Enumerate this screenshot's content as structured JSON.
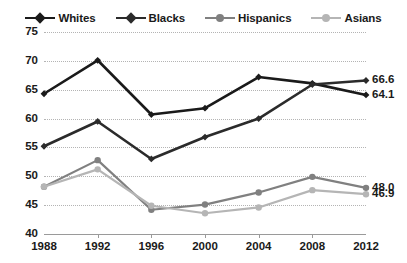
{
  "chart_data": {
    "type": "line",
    "title": "",
    "subtitle": "",
    "xlabel": "",
    "ylabel": "",
    "x": [
      1988,
      1992,
      1996,
      2000,
      2004,
      2008,
      2012
    ],
    "categories": [
      "1988",
      "1992",
      "1996",
      "2000",
      "2004",
      "2008",
      "2012"
    ],
    "xtick_labels": [
      "1988",
      "1992",
      "1996",
      "2000",
      "2004",
      "2008",
      "2012"
    ],
    "ytick_labels": [
      "40",
      "45",
      "50",
      "55",
      "60",
      "65",
      "70",
      "75"
    ],
    "yticks": [
      40,
      45,
      50,
      55,
      60,
      65,
      70,
      75
    ],
    "ylim": [
      40,
      75
    ],
    "grid": "horizontal-dotted",
    "legend_position": "top-center",
    "series": [
      {
        "name": "Whites",
        "color": "#1a1a1a",
        "marker": "diamond",
        "values": [
          64.3,
          70.1,
          60.7,
          61.8,
          67.2,
          66.1,
          64.1
        ],
        "end_label": "64.1"
      },
      {
        "name": "Blacks",
        "color": "#2b2b2b",
        "marker": "diamond",
        "values": [
          55.2,
          59.5,
          53.0,
          56.8,
          60.0,
          65.9,
          66.6
        ],
        "end_label": "66.6"
      },
      {
        "name": "Hispanics",
        "color": "#808080",
        "marker": "circle",
        "values": [
          48.2,
          52.8,
          44.2,
          45.1,
          47.2,
          49.9,
          48.0
        ],
        "end_label": "48.0"
      },
      {
        "name": "Asians",
        "color": "#b5b5b5",
        "marker": "circle",
        "values": [
          48.2,
          51.2,
          44.9,
          43.6,
          44.6,
          47.6,
          46.9
        ],
        "end_label": "46.9"
      }
    ],
    "end_labels": [
      {
        "text": "66.6",
        "series": "Blacks"
      },
      {
        "text": "64.1",
        "series": "Whites"
      },
      {
        "text": "48.0",
        "series": "Hispanics"
      },
      {
        "text": "46.9",
        "series": "Asians"
      }
    ]
  },
  "legend": {
    "items": [
      {
        "label": "Whites"
      },
      {
        "label": "Blacks"
      },
      {
        "label": "Hispanics"
      },
      {
        "label": "Asians"
      }
    ]
  }
}
